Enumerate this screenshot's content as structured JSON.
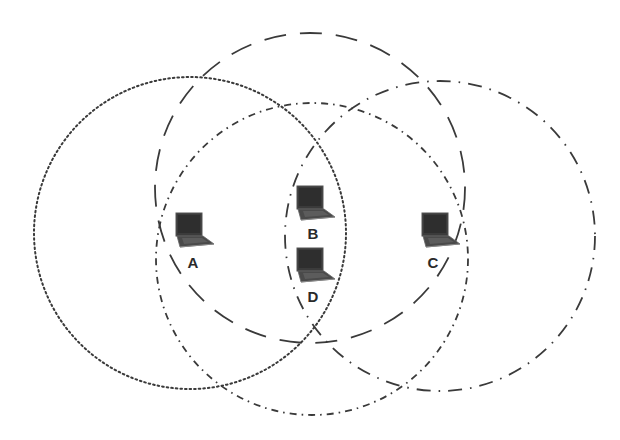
{
  "diagram": {
    "type": "wireless-network-range-overlap",
    "background": "#ffffff",
    "stroke_color": "#3a3a3a",
    "nodes": [
      {
        "id": "A",
        "label": "A",
        "x": 176,
        "y": 213,
        "label_x": 193,
        "label_y": 268
      },
      {
        "id": "B",
        "label": "B",
        "x": 297,
        "y": 186,
        "label_x": 313,
        "label_y": 239
      },
      {
        "id": "D",
        "label": "D",
        "x": 297,
        "y": 248,
        "label_x": 313,
        "label_y": 302
      },
      {
        "id": "C",
        "label": "C",
        "x": 422,
        "y": 213,
        "label_x": 433,
        "label_y": 268
      }
    ],
    "ranges": [
      {
        "node": "A",
        "style": "dotted",
        "cx": 190,
        "cy": 233,
        "r": 156,
        "dash": "1.6 3"
      },
      {
        "node": "B",
        "style": "long-dash",
        "cx": 310,
        "cy": 188,
        "r": 155,
        "dash": "22 14"
      },
      {
        "node": "D",
        "style": "dash-dot",
        "cx": 312,
        "cy": 259,
        "r": 156,
        "dash": "7 5 1.6 5"
      },
      {
        "node": "C",
        "style": "long-dash-dot",
        "cx": 440,
        "cy": 236,
        "r": 155,
        "dash": "14 8 1.6 8"
      }
    ]
  }
}
